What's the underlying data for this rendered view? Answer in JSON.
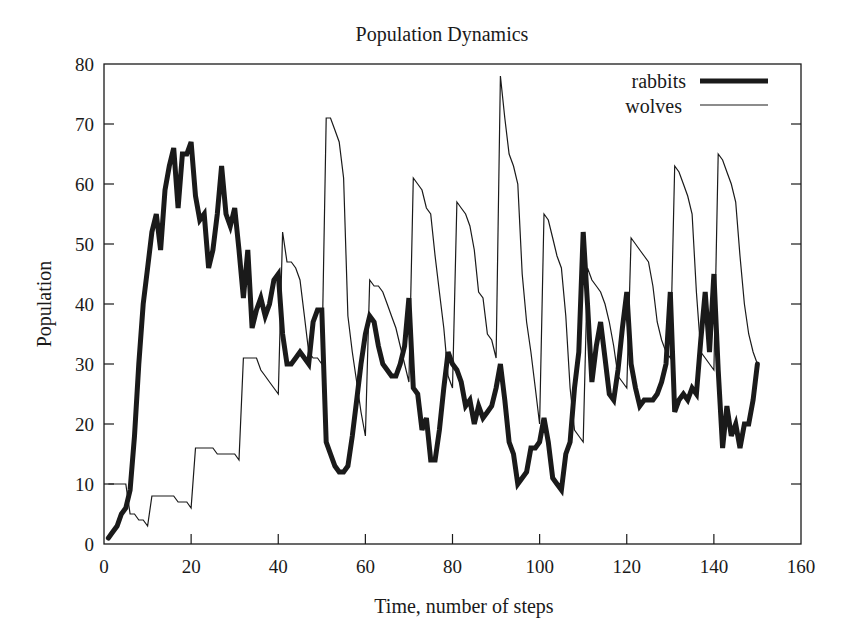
{
  "chart_data": {
    "type": "line",
    "title": "Population Dynamics",
    "xlabel": "Time, number of steps",
    "ylabel": "Population",
    "xlim": [
      0,
      160
    ],
    "ylim": [
      0,
      80
    ],
    "xticks": [
      0,
      20,
      40,
      60,
      80,
      100,
      120,
      140,
      160
    ],
    "yticks": [
      0,
      10,
      20,
      30,
      40,
      50,
      60,
      70,
      80
    ],
    "grid": false,
    "legend_position": "upper right",
    "x": [
      1,
      2,
      3,
      4,
      5,
      6,
      7,
      8,
      9,
      10,
      11,
      12,
      13,
      14,
      15,
      16,
      17,
      18,
      19,
      20,
      21,
      22,
      23,
      24,
      25,
      26,
      27,
      28,
      29,
      30,
      31,
      32,
      33,
      34,
      35,
      36,
      37,
      38,
      39,
      40,
      41,
      42,
      43,
      44,
      45,
      46,
      47,
      48,
      49,
      50,
      51,
      52,
      53,
      54,
      55,
      56,
      57,
      58,
      59,
      60,
      61,
      62,
      63,
      64,
      65,
      66,
      67,
      68,
      69,
      70,
      71,
      72,
      73,
      74,
      75,
      76,
      77,
      78,
      79,
      80,
      81,
      82,
      83,
      84,
      85,
      86,
      87,
      88,
      89,
      90,
      91,
      92,
      93,
      94,
      95,
      96,
      97,
      98,
      99,
      100,
      101,
      102,
      103,
      104,
      105,
      106,
      107,
      108,
      109,
      110,
      111,
      112,
      113,
      114,
      115,
      116,
      117,
      118,
      119,
      120,
      121,
      122,
      123,
      124,
      125,
      126,
      127,
      128,
      129,
      130,
      131,
      132,
      133,
      134,
      135,
      136,
      137,
      138,
      139,
      140,
      141,
      142,
      143,
      144,
      145,
      146,
      147,
      148,
      149,
      150
    ],
    "series": [
      {
        "name": "rabbits",
        "style": "thick",
        "color": "#1a1a1a",
        "values": [
          1,
          2,
          3,
          5,
          6,
          9,
          18,
          30,
          40,
          46,
          52,
          55,
          49,
          59,
          63,
          66,
          56,
          65,
          65,
          67,
          58,
          54,
          55,
          46,
          49,
          55,
          63,
          55,
          53,
          56,
          49,
          41,
          49,
          36,
          39,
          41,
          38,
          40,
          44,
          45,
          35,
          30,
          30,
          31,
          32,
          31,
          30,
          37,
          39,
          39,
          17,
          15,
          13,
          12,
          12,
          13,
          18,
          24,
          30,
          35,
          38,
          37,
          33,
          30,
          29,
          28,
          28,
          30,
          33,
          41,
          26,
          25,
          19,
          21,
          14,
          14,
          19,
          26,
          32,
          30,
          29,
          27,
          23,
          24,
          20,
          23,
          21,
          22,
          23,
          26,
          30,
          24,
          17,
          15,
          10,
          11,
          12,
          16,
          16,
          17,
          21,
          17,
          11,
          10,
          9,
          15,
          17,
          26,
          32,
          52,
          40,
          27,
          33,
          37,
          31,
          25,
          24,
          29,
          36,
          42,
          30,
          26,
          23,
          24,
          24,
          24,
          25,
          27,
          30,
          42,
          22,
          24,
          25,
          24,
          26,
          25,
          34,
          42,
          32,
          45,
          29,
          16,
          23,
          18,
          20,
          16,
          20,
          20,
          24,
          30
        ]
      },
      {
        "name": "wolves",
        "style": "thin",
        "color": "#1a1a1a",
        "values": [
          10,
          10,
          10,
          10,
          10,
          5,
          5,
          4,
          4,
          3,
          8,
          8,
          8,
          8,
          8,
          8,
          7,
          7,
          7,
          6,
          16,
          16,
          16,
          16,
          16,
          15,
          15,
          15,
          15,
          15,
          14,
          31,
          31,
          31,
          31,
          29,
          28,
          27,
          26,
          25,
          52,
          47,
          47,
          46,
          44,
          38,
          32,
          31,
          31,
          30,
          71,
          71,
          69,
          67,
          61,
          38,
          32,
          27,
          22,
          18,
          44,
          43,
          43,
          42,
          40,
          38,
          36,
          33,
          30,
          27,
          61,
          60,
          59,
          56,
          55,
          48,
          42,
          36,
          28,
          26,
          57,
          56,
          55,
          53,
          49,
          42,
          41,
          35,
          34,
          31,
          78,
          71,
          65,
          63,
          60,
          45,
          37,
          32,
          26,
          20,
          55,
          54,
          51,
          48,
          46,
          38,
          26,
          19,
          18,
          17,
          46,
          44,
          43,
          42,
          40,
          37,
          33,
          28,
          27,
          26,
          51,
          50,
          49,
          48,
          47,
          43,
          37,
          34,
          32,
          31,
          63,
          62,
          60,
          58,
          55,
          42,
          32,
          31,
          30,
          29,
          65,
          64,
          62,
          60,
          57,
          48,
          40,
          35,
          32,
          30
        ]
      }
    ]
  },
  "title": "Population Dynamics",
  "axes": {
    "xlabel": "Time, number of steps",
    "ylabel": "Population",
    "xticks": [
      "0",
      "20",
      "40",
      "60",
      "80",
      "100",
      "120",
      "140",
      "160"
    ],
    "yticks": [
      "0",
      "10",
      "20",
      "30",
      "40",
      "50",
      "60",
      "70",
      "80"
    ]
  },
  "legend": {
    "items": [
      {
        "label": "rabbits"
      },
      {
        "label": "wolves"
      }
    ]
  }
}
